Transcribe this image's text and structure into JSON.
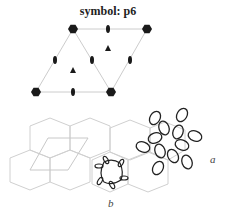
{
  "title": "symbol: p6",
  "labels": {
    "a": "a",
    "b": "b"
  },
  "colors": {
    "lattice_line": "#cccccc",
    "symbol": "#1a1a1a",
    "tiling": "#d0d0d0",
    "motif": "#222222"
  },
  "symbol_diagram": {
    "six_fold_centers": [
      [
        73,
        29
      ],
      [
        147,
        29
      ],
      [
        36,
        92
      ],
      [
        111,
        92
      ]
    ],
    "two_fold_centers": [
      [
        108,
        29
      ],
      [
        55,
        60
      ],
      [
        92,
        60
      ],
      [
        130,
        60
      ],
      [
        73,
        92
      ]
    ],
    "three_fold_centers": [
      [
        108,
        48
      ],
      [
        73,
        70
      ]
    ]
  }
}
